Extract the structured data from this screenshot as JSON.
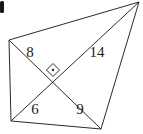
{
  "figure": {
    "kind": "quadrilateral-with-perpendicular-diagonals",
    "stroke_color": "#2b2b2b",
    "label_color": "#1a1a1a",
    "background_color": "#ffffff",
    "vertices": [
      {
        "id": "A",
        "role": "top-left",
        "x": 9,
        "y": 40
      },
      {
        "id": "B",
        "role": "top-right",
        "x": 139,
        "y": 2
      },
      {
        "id": "C",
        "role": "bottom-right",
        "x": 101,
        "y": 129
      },
      {
        "id": "D",
        "role": "bottom-left",
        "x": 11,
        "y": 121
      }
    ],
    "intersection": {
      "id": "P",
      "x": 55,
      "y": 76
    },
    "edges": [
      {
        "id": "AB",
        "from": "A",
        "to": "B",
        "label": ""
      },
      {
        "id": "BC",
        "from": "B",
        "to": "C",
        "label": ""
      },
      {
        "id": "CD",
        "from": "C",
        "to": "D",
        "label": ""
      },
      {
        "id": "DA",
        "from": "D",
        "to": "A",
        "label": ""
      }
    ],
    "diagonals": [
      {
        "id": "AC",
        "from": "A",
        "to": "C"
      },
      {
        "id": "DB",
        "from": "D",
        "to": "B"
      }
    ],
    "right_angle_marker": {
      "present": true,
      "style": "square-with-center-dot",
      "center_x": 53,
      "center_y": 70,
      "half_size": 6
    },
    "segment_labels": [
      {
        "id": "label-8",
        "text": "8",
        "segment": "A-P",
        "x": 30,
        "y": 57
      },
      {
        "id": "label-14",
        "text": "14",
        "segment": "P-B",
        "x": 91,
        "y": 57
      },
      {
        "id": "label-6",
        "text": "6",
        "segment": "D-P",
        "x": 31,
        "y": 114
      },
      {
        "id": "label-9",
        "text": "9",
        "segment": "P-C",
        "x": 75,
        "y": 114
      }
    ],
    "left_edge_artifact": {
      "present": true,
      "x": 0,
      "y": 1,
      "width": 4,
      "height": 12
    }
  }
}
